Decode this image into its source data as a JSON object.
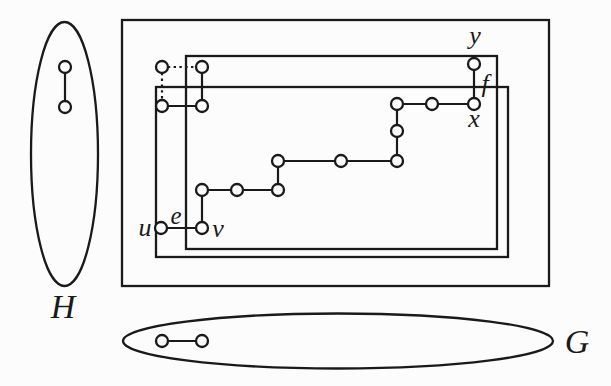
{
  "figure": {
    "width": 611,
    "height": 386,
    "colors": {
      "background": "#fcfcfc",
      "ink": "#1a1a1a",
      "vertex_fill": "#fcfcfc"
    },
    "containers": [
      {
        "name": "graph-H-ellipse",
        "type": "ellipse",
        "cx": 64.5,
        "cy": 154,
        "rx": 33.5,
        "ry": 132
      },
      {
        "name": "outer-box",
        "type": "rect",
        "x": 122,
        "y": 20,
        "w": 427,
        "h": 266
      },
      {
        "name": "inner-box-upper",
        "type": "rect",
        "x": 186,
        "y": 56,
        "w": 311,
        "h": 193
      },
      {
        "name": "inner-box-lower",
        "type": "rect",
        "x": 156,
        "y": 87,
        "w": 352,
        "h": 170
      },
      {
        "name": "graph-G-ellipse",
        "type": "ellipse",
        "cx": 338,
        "cy": 341,
        "rx": 215,
        "ry": 27.5
      }
    ],
    "vertices": [
      {
        "id": "h1",
        "x": 65,
        "y": 67
      },
      {
        "id": "h2",
        "x": 65,
        "y": 107
      },
      {
        "id": "a1",
        "x": 162,
        "y": 67
      },
      {
        "id": "a2",
        "x": 202,
        "y": 67
      },
      {
        "id": "a3",
        "x": 162,
        "y": 106
      },
      {
        "id": "a4",
        "x": 202,
        "y": 106
      },
      {
        "id": "u",
        "x": 161,
        "y": 228
      },
      {
        "id": "v",
        "x": 202,
        "y": 228
      },
      {
        "id": "p3",
        "x": 202,
        "y": 190
      },
      {
        "id": "p4",
        "x": 237,
        "y": 190
      },
      {
        "id": "p5",
        "x": 278,
        "y": 190
      },
      {
        "id": "p6",
        "x": 278,
        "y": 161
      },
      {
        "id": "p7",
        "x": 341,
        "y": 161
      },
      {
        "id": "p8",
        "x": 397,
        "y": 161
      },
      {
        "id": "p9",
        "x": 397,
        "y": 131
      },
      {
        "id": "p10",
        "x": 397,
        "y": 104
      },
      {
        "id": "p11",
        "x": 432,
        "y": 104
      },
      {
        "id": "x",
        "x": 474,
        "y": 104
      },
      {
        "id": "y",
        "x": 474,
        "y": 64
      },
      {
        "id": "g1",
        "x": 162,
        "y": 341
      },
      {
        "id": "g2",
        "x": 202,
        "y": 341
      }
    ],
    "edges": [
      {
        "from": "h1",
        "to": "h2",
        "style": "solid"
      },
      {
        "from": "a1",
        "to": "a2",
        "style": "dotted"
      },
      {
        "from": "a1",
        "to": "a3",
        "style": "dotted"
      },
      {
        "from": "a2",
        "to": "a4",
        "style": "solid"
      },
      {
        "from": "a3",
        "to": "a4",
        "style": "solid"
      },
      {
        "from": "u",
        "to": "v",
        "style": "solid"
      },
      {
        "from": "v",
        "to": "p3",
        "style": "solid"
      },
      {
        "from": "p3",
        "to": "p4",
        "style": "solid"
      },
      {
        "from": "p4",
        "to": "p5",
        "style": "solid"
      },
      {
        "from": "p5",
        "to": "p6",
        "style": "solid"
      },
      {
        "from": "p6",
        "to": "p7",
        "style": "solid"
      },
      {
        "from": "p7",
        "to": "p8",
        "style": "solid"
      },
      {
        "from": "p8",
        "to": "p9",
        "style": "solid"
      },
      {
        "from": "p9",
        "to": "p10",
        "style": "solid"
      },
      {
        "from": "p10",
        "to": "p11",
        "style": "solid"
      },
      {
        "from": "p11",
        "to": "x",
        "style": "solid"
      },
      {
        "from": "x",
        "to": "y",
        "style": "solid"
      },
      {
        "from": "g1",
        "to": "g2",
        "style": "solid"
      }
    ],
    "labels": [
      {
        "id": "label-graph-H",
        "text": "H",
        "x": 63,
        "y": 318,
        "size": 34
      },
      {
        "id": "label-graph-G",
        "text": "G",
        "x": 577,
        "y": 353,
        "size": 34
      },
      {
        "id": "label-vertex-u",
        "text": "u",
        "x": 145,
        "y": 236,
        "size": 26
      },
      {
        "id": "label-edge-e",
        "text": "e",
        "x": 176,
        "y": 224,
        "size": 25
      },
      {
        "id": "label-vertex-v",
        "text": "v",
        "x": 218,
        "y": 237,
        "size": 26
      },
      {
        "id": "label-vertex-y",
        "text": "y",
        "x": 475,
        "y": 44,
        "size": 26
      },
      {
        "id": "label-edge-f",
        "text": "f",
        "x": 485,
        "y": 92,
        "size": 26
      },
      {
        "id": "label-vertex-x",
        "text": "x",
        "x": 474,
        "y": 127,
        "size": 26
      }
    ]
  }
}
